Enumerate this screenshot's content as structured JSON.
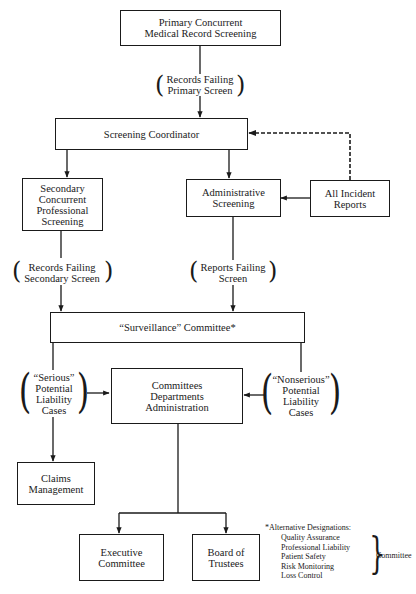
{
  "diagram": {
    "nodes": {
      "primary": "Primary Concurrent\nMedical Record Screening",
      "coordinator": "Screening Coordinator",
      "secondary": "Secondary\nConcurrent\nProfessional\nScreening",
      "administrative": "Administrative\nScreening",
      "incident": "All Incident\nReports",
      "surveillance": "“Surveillance” Committee*",
      "committees": "Committees\nDepartments\nAdministration",
      "claims": "Claims\nManagement",
      "executive": "Executive\nCommittee",
      "board": "Board of\nTrustees"
    },
    "edge_labels": {
      "records_failing_primary": "Records Failing\nPrimary Screen",
      "records_failing_secondary": "Records Failing\nSecondary Screen",
      "reports_failing": "Reports Failing\nScreen",
      "serious": "“Serious”\nPotential\nLiability\nCases",
      "nonserious": "“Nonserious”\nPotential\nLiability\nCases"
    },
    "footnote": {
      "heading": "*Alternative Designations:",
      "items": [
        "Quality Assurance",
        "Professional Liability",
        "Patient Safety",
        "Risk Monitoring",
        "Loss Control"
      ],
      "suffix": "Committee"
    },
    "edges": [
      {
        "from": "primary",
        "to": "coordinator",
        "label": "records_failing_primary",
        "style": "solid"
      },
      {
        "from": "coordinator",
        "to": "secondary",
        "style": "solid"
      },
      {
        "from": "coordinator",
        "to": "administrative",
        "style": "solid"
      },
      {
        "from": "incident",
        "to": "administrative",
        "style": "solid"
      },
      {
        "from": "incident",
        "to": "coordinator",
        "style": "dashed"
      },
      {
        "from": "secondary",
        "to": "surveillance",
        "label": "records_failing_secondary",
        "style": "solid"
      },
      {
        "from": "administrative",
        "to": "surveillance",
        "label": "reports_failing",
        "style": "solid"
      },
      {
        "from": "surveillance",
        "to": "committees",
        "label": "serious",
        "style": "solid"
      },
      {
        "from": "surveillance",
        "to": "claims",
        "label": "serious",
        "style": "solid"
      },
      {
        "from": "surveillance",
        "to": "committees",
        "label": "nonserious",
        "style": "solid"
      },
      {
        "from": "committees",
        "to": "executive",
        "style": "solid"
      },
      {
        "from": "committees",
        "to": "board",
        "style": "solid"
      }
    ]
  }
}
